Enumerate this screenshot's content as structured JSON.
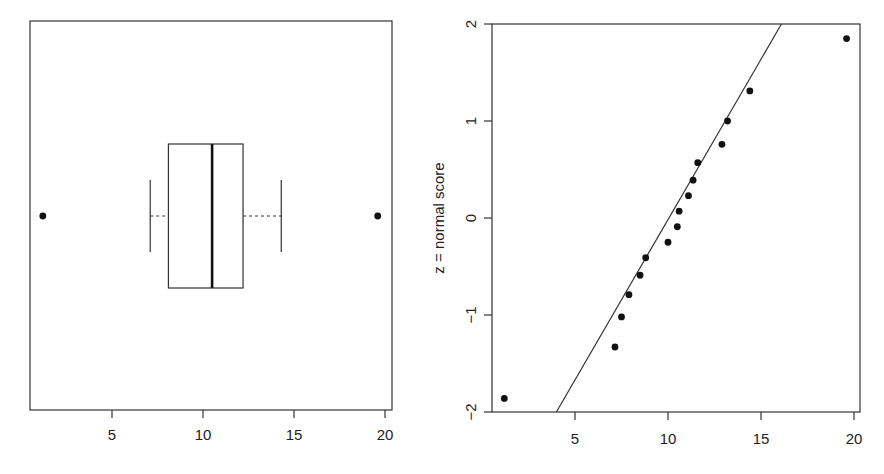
{
  "chart_data": [
    {
      "type": "boxplot",
      "orientation": "horizontal",
      "title": "",
      "xlabel": "",
      "ylabel": "",
      "xlim": [
        0.5,
        20.3
      ],
      "x_ticks": [
        5,
        10,
        15,
        20
      ],
      "x_tick_labels": [
        "5",
        "10",
        "15",
        "20"
      ],
      "stats": {
        "lower_whisker": 7.1,
        "q1": 8.1,
        "median": 10.5,
        "q3": 12.2,
        "upper_whisker": 14.3
      },
      "outliers": [
        1.2,
        19.6
      ],
      "grid": false
    },
    {
      "type": "scatter",
      "subtype": "normal-probability-plot",
      "title": "",
      "xlabel": "",
      "ylabel": "z = normal score",
      "xlim": [
        1.0,
        20.3
      ],
      "ylim": [
        -2,
        2
      ],
      "x_ticks": [
        5,
        10,
        15,
        20
      ],
      "x_tick_labels": [
        "5",
        "10",
        "15",
        "20"
      ],
      "y_ticks": [
        -2,
        -1,
        0,
        1,
        2
      ],
      "y_tick_labels": [
        "-2",
        "-1",
        "0",
        "1",
        "2"
      ],
      "points": [
        {
          "x": 1.2,
          "z": -1.86
        },
        {
          "x": 7.15,
          "z": -1.33
        },
        {
          "x": 7.5,
          "z": -1.02
        },
        {
          "x": 7.9,
          "z": -0.79
        },
        {
          "x": 8.5,
          "z": -0.59
        },
        {
          "x": 8.8,
          "z": -0.41
        },
        {
          "x": 10.0,
          "z": -0.25
        },
        {
          "x": 10.5,
          "z": -0.09
        },
        {
          "x": 10.6,
          "z": 0.07
        },
        {
          "x": 11.1,
          "z": 0.23
        },
        {
          "x": 11.35,
          "z": 0.39
        },
        {
          "x": 11.6,
          "z": 0.57
        },
        {
          "x": 12.9,
          "z": 0.76
        },
        {
          "x": 13.2,
          "z": 1.0
        },
        {
          "x": 14.4,
          "z": 1.31
        },
        {
          "x": 19.6,
          "z": 1.85
        }
      ],
      "reference_line": {
        "x_at_z_minus2": 4.0,
        "x_at_z_plus2": 16.1
      },
      "grid": false
    }
  ],
  "left": {
    "ticks": [
      "5",
      "10",
      "15",
      "20"
    ]
  },
  "right": {
    "ylabel": "z = normal score",
    "xticks": [
      "5",
      "10",
      "15",
      "20"
    ],
    "yticks": [
      "-2",
      "-1",
      "0",
      "1",
      "2"
    ]
  }
}
